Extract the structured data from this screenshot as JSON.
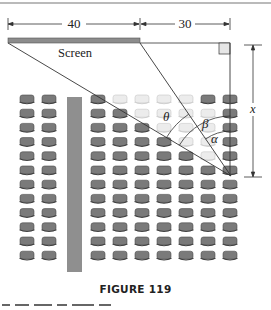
{
  "figure": {
    "caption": "FIGURE 119",
    "screen_label": "Screen",
    "dimensions": {
      "screen_width_label": "40",
      "offset_label": "30",
      "distance_label": "x"
    },
    "angles": [
      {
        "name": "theta",
        "symbol": "θ"
      },
      {
        "name": "beta",
        "symbol": "β"
      },
      {
        "name": "alpha",
        "symbol": "α"
      }
    ],
    "seating": {
      "left_block_columns": 2,
      "right_block_columns": 7,
      "rows": 12,
      "highlighted_light_seats": [
        [
          0,
          1
        ],
        [
          0,
          2
        ],
        [
          0,
          3
        ],
        [
          0,
          4
        ],
        [
          1,
          2
        ],
        [
          1,
          3
        ],
        [
          1,
          4
        ],
        [
          1,
          5
        ],
        [
          2,
          3
        ],
        [
          2,
          4
        ],
        [
          2,
          5
        ],
        [
          3,
          4
        ],
        [
          3,
          5
        ],
        [
          4,
          5
        ]
      ]
    },
    "colors": {
      "screen": "#8c8c8c",
      "aisle": "#8f8f8f",
      "seat_dark": "#7a7a7a",
      "seat_light": "#ececec",
      "line": "#333333"
    }
  }
}
